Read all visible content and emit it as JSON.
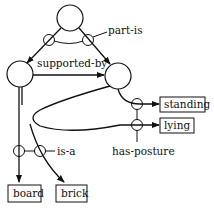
{
  "diagram": {
    "type": "semantic-network",
    "nodes": [
      {
        "id": "top",
        "shape": "circle",
        "label": ""
      },
      {
        "id": "left",
        "shape": "circle",
        "label": ""
      },
      {
        "id": "right",
        "shape": "circle",
        "label": ""
      }
    ],
    "boxes": {
      "standing": "standing",
      "lying": "lying",
      "board": "board",
      "brick": "brick"
    },
    "relations": {
      "part_is": "part-is",
      "supported_by": "supported-by",
      "has_posture": "has-posture",
      "is_a": "is-a"
    },
    "colors": {
      "stroke": "#111111",
      "background": "#ffffff"
    }
  }
}
